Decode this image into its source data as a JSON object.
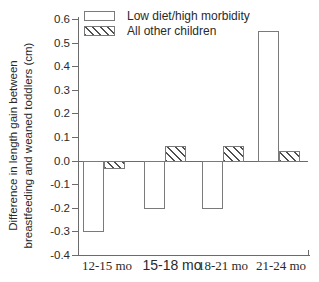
{
  "window": {
    "background": "#ffffff"
  },
  "chart_data": {
    "type": "bar",
    "title": "",
    "xlabel": "",
    "ylabel": "Difference in length gain between breastfeeding and weaned toddlers (cm)",
    "ylabel_lines": [
      "Difference in length gain between",
      "breastfeeding and weaned toddlers (cm)"
    ],
    "categories": [
      "12-15 mo",
      "15-18 mo",
      "18-21 mo",
      "21-24 mo"
    ],
    "series": [
      {
        "name": "Low diet/high morbidity",
        "fill": "open-white",
        "values": [
          -0.3,
          -0.2,
          -0.2,
          0.55
        ]
      },
      {
        "name": "All other children",
        "fill": "hatched-diagonal",
        "values": [
          -0.03,
          0.06,
          0.06,
          0.04
        ]
      }
    ],
    "ylim": [
      -0.4,
      0.6
    ],
    "y_tick_labels": [
      "0.6",
      "0.5",
      "0.4",
      "0.3",
      "0.2",
      "0.1",
      "0.0",
      "-0.1",
      "-0.2",
      "-0.3",
      "-0.4"
    ],
    "grid": false,
    "zero_line": true,
    "legend_position": "top-left"
  },
  "legend": {
    "items": [
      {
        "label": "Low diet/high morbidity",
        "swatch": "open-rect"
      },
      {
        "label": "All other children",
        "swatch": "hatched-rect"
      }
    ]
  },
  "colors": {
    "axis": "#6b6b6b",
    "bar_outline": "#7a7a7a",
    "hatch": "#4f4f4f",
    "text": "#2a2a2a",
    "background": "#ffffff"
  }
}
